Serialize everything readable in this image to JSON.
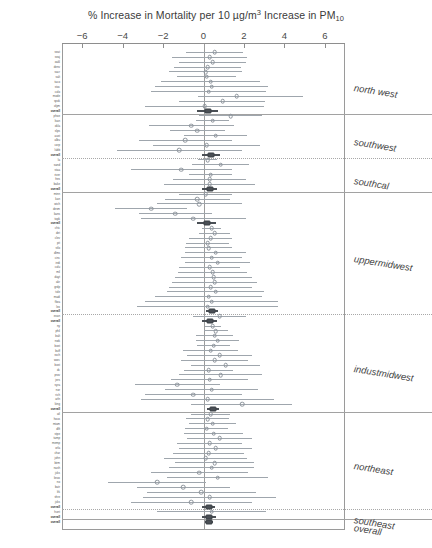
{
  "chart": {
    "type": "forest",
    "title_parts": {
      "pre": "% Increase in Mortality per 10 µg/m",
      "sup": "3",
      "mid": " Increase in PM",
      "sub": "10"
    },
    "title_plain": "% Increase in Mortality per 10 µg/m3 Increase in PM10",
    "xlabel": "",
    "ylabel": "",
    "xlim": [
      -7,
      7
    ],
    "xticks": [
      -6,
      -4,
      -2,
      0,
      2,
      4,
      6
    ],
    "xtick_labels": [
      "−6",
      "−4",
      "−2",
      "0",
      "2",
      "4",
      "6"
    ],
    "zero_reference": 0,
    "grid": false,
    "legend": null,
    "marker_open": "city estimate",
    "marker_filled": "regional / overall pooled estimate",
    "colors": {
      "point": "#8d949c",
      "ci": "#9fa6ad",
      "pooled": "#4a4f55",
      "axis": "#9a9a9a",
      "separator": "#a8a8a8",
      "text": "#3a3a3a"
    }
  },
  "regions": [
    {
      "name": "north west",
      "separator": "solid",
      "cities": [
        {
          "label": "seat",
          "est": 0.55,
          "lo": -0.85,
          "hi": 1.95,
          "pooled": false
        },
        {
          "label": "seaj",
          "est": 0.3,
          "lo": -1.55,
          "hi": 2.15,
          "pooled": false
        },
        {
          "label": "oakl",
          "est": 0.45,
          "lo": -1.2,
          "hi": 2.1,
          "pooled": false
        },
        {
          "label": "denv",
          "est": 0.2,
          "lo": -1.45,
          "hi": 1.85,
          "pooled": false
        },
        {
          "label": "sacr",
          "est": 0.1,
          "lo": -1.7,
          "hi": 1.9,
          "pooled": false
        },
        {
          "label": "salt",
          "est": 0.15,
          "lo": -1.3,
          "hi": 1.6,
          "pooled": false
        },
        {
          "label": "taco",
          "est": 0.35,
          "lo": -2.1,
          "hi": 2.8,
          "pooled": false
        },
        {
          "label": "stoc",
          "est": 0.4,
          "lo": -2.4,
          "hi": 3.2,
          "pooled": false
        },
        {
          "label": "colo",
          "est": 0.25,
          "lo": -2.6,
          "hi": 3.1,
          "pooled": false
        },
        {
          "label": "mode",
          "est": 1.65,
          "lo": -0.25,
          "hi": 4.9,
          "pooled": false
        },
        {
          "label": "spok",
          "est": 0.95,
          "lo": -1.2,
          "hi": 3.05,
          "pooled": false
        },
        {
          "label": "olym",
          "est": 0.05,
          "lo": -2.9,
          "hi": 3.0,
          "pooled": false
        },
        {
          "label": "overall",
          "est": 0.22,
          "lo": -0.3,
          "hi": 0.74,
          "pooled": true
        }
      ]
    },
    {
      "name": "southwest",
      "separator": "solid",
      "cities": [
        {
          "label": "phoe",
          "est": 1.35,
          "lo": -0.2,
          "hi": 2.9,
          "pooled": false
        },
        {
          "label": "lsan",
          "est": 0.45,
          "lo": -0.35,
          "hi": 1.25,
          "pooled": false
        },
        {
          "label": "okla",
          "est": -0.6,
          "lo": -2.7,
          "hi": 1.5,
          "pooled": false
        },
        {
          "label": "slps",
          "est": -0.3,
          "lo": -1.65,
          "hi": 1.05,
          "pooled": false
        },
        {
          "label": "aust",
          "est": 0.6,
          "lo": -0.95,
          "hi": 2.15,
          "pooled": false
        },
        {
          "label": "albu",
          "est": -0.9,
          "lo": -3.2,
          "hi": 1.4,
          "pooled": false
        },
        {
          "label": "corp",
          "est": 0.15,
          "lo": -2.5,
          "hi": 2.8,
          "pooled": false
        },
        {
          "label": "lubb",
          "est": -1.2,
          "lo": -4.3,
          "hi": 1.9,
          "pooled": false
        },
        {
          "label": "overall",
          "est": 0.38,
          "lo": -0.05,
          "hi": 0.81,
          "pooled": true
        }
      ]
    },
    {
      "name": "southcal",
      "separator": "dotted",
      "cities": [
        {
          "label": "la",
          "est": 0.2,
          "lo": -0.25,
          "hi": 0.65,
          "pooled": false
        },
        {
          "label": "sand",
          "est": 0.85,
          "lo": -0.55,
          "hi": 2.25,
          "pooled": false
        },
        {
          "label": "staa",
          "est": -1.1,
          "lo": -3.6,
          "hi": 1.4,
          "pooled": false
        },
        {
          "label": "river",
          "est": 0.35,
          "lo": -0.7,
          "hi": 1.4,
          "pooled": false
        },
        {
          "label": "fres",
          "est": 0.3,
          "lo": -1.5,
          "hi": 2.1,
          "pooled": false
        },
        {
          "label": "bake",
          "est": 0.3,
          "lo": -1.95,
          "hi": 2.55,
          "pooled": false
        },
        {
          "label": "overall",
          "est": 0.3,
          "lo": -0.05,
          "hi": 0.65,
          "pooled": true
        }
      ]
    },
    {
      "name": "uppermidwest",
      "separator": "solid",
      "cities": [
        {
          "label": "minn",
          "est": 0.1,
          "lo": -1.2,
          "hi": 1.4,
          "pooled": false
        },
        {
          "label": "kan",
          "est": -0.3,
          "lo": -1.9,
          "hi": 1.3,
          "pooled": false
        },
        {
          "label": "wich",
          "est": -0.2,
          "lo": -2.3,
          "hi": 1.9,
          "pooled": false
        },
        {
          "label": "desm",
          "est": -2.6,
          "lo": -4.4,
          "hi": -0.8,
          "pooled": false
        },
        {
          "label": "kans",
          "est": -1.4,
          "lo": -3.2,
          "hi": 0.4,
          "pooled": false
        },
        {
          "label": "topk",
          "est": -0.5,
          "lo": -3.1,
          "hi": 2.1,
          "pooled": false
        },
        {
          "label": "overall",
          "est": 0.15,
          "lo": -0.3,
          "hi": 0.6,
          "pooled": true
        },
        {
          "label": "chic",
          "est": 0.4,
          "lo": -0.05,
          "hi": 0.85,
          "pooled": false
        },
        {
          "label": "det",
          "est": 0.55,
          "lo": -0.2,
          "hi": 1.3,
          "pooled": false
        },
        {
          "label": "clev",
          "est": 0.35,
          "lo": -0.7,
          "hi": 1.4,
          "pooled": false
        },
        {
          "label": "pit",
          "est": 0.2,
          "lo": -0.85,
          "hi": 1.25,
          "pooled": false
        },
        {
          "label": "stlo",
          "est": 0.25,
          "lo": -0.9,
          "hi": 1.4,
          "pooled": false
        },
        {
          "label": "dlms",
          "est": 0.6,
          "lo": -0.9,
          "hi": 2.1,
          "pooled": false
        },
        {
          "label": "cinc",
          "est": 0.4,
          "lo": -1.1,
          "hi": 1.9,
          "pooled": false
        },
        {
          "label": "indi",
          "est": 0.7,
          "lo": -0.9,
          "hi": 2.3,
          "pooled": false
        },
        {
          "label": "colu",
          "est": 0.3,
          "lo": -1.2,
          "hi": 1.8,
          "pooled": false
        },
        {
          "label": "mil",
          "est": 0.45,
          "lo": -1.25,
          "hi": 2.15,
          "pooled": false
        },
        {
          "label": "dayt",
          "est": 0.5,
          "lo": -1.4,
          "hi": 2.4,
          "pooled": false
        },
        {
          "label": "akr",
          "est": 0.55,
          "lo": -1.55,
          "hi": 2.65,
          "pooled": false
        },
        {
          "label": "grdp",
          "est": 0.35,
          "lo": -1.7,
          "hi": 2.4,
          "pooled": false
        },
        {
          "label": "tole",
          "est": 0.6,
          "lo": -1.8,
          "hi": 3.0,
          "pooled": false
        },
        {
          "label": "madi",
          "est": 0.25,
          "lo": -2.4,
          "hi": 2.9,
          "pooled": false
        },
        {
          "label": "flwa",
          "est": 0.4,
          "lo": -2.9,
          "hi": 3.7,
          "pooled": false
        },
        {
          "label": "lex",
          "est": 0.2,
          "lo": -3.3,
          "hi": 3.7,
          "pooled": false
        },
        {
          "label": "overall",
          "est": 0.42,
          "lo": 0.1,
          "hi": 0.74,
          "pooled": true
        }
      ]
    },
    {
      "name": "industmidwest",
      "separator": "dotted",
      "cities": [
        {
          "label": "evan",
          "est": 0.8,
          "lo": -0.5,
          "hi": 2.1,
          "pooled": false
        },
        {
          "label": "overall",
          "est": 0.3,
          "lo": -0.05,
          "hi": 0.65,
          "pooled": true
        },
        {
          "label": "ny",
          "est": 0.45,
          "lo": 0.05,
          "hi": 0.85,
          "pooled": false
        },
        {
          "label": "phil",
          "est": 0.6,
          "lo": 0.0,
          "hi": 1.2,
          "pooled": false
        },
        {
          "label": "balt",
          "est": 0.55,
          "lo": -0.35,
          "hi": 1.45,
          "pooled": false
        },
        {
          "label": "nwk",
          "est": 0.7,
          "lo": -0.35,
          "hi": 1.75,
          "pooled": false
        },
        {
          "label": "bost",
          "est": 0.5,
          "lo": -0.3,
          "hi": 1.3,
          "pooled": false
        },
        {
          "label": "buff",
          "est": 0.35,
          "lo": -1.0,
          "hi": 1.7,
          "pooled": false
        },
        {
          "label": "roch",
          "est": 0.8,
          "lo": -0.8,
          "hi": 2.4,
          "pooled": false
        },
        {
          "label": "worc",
          "est": 0.55,
          "lo": -1.1,
          "hi": 2.2,
          "pooled": false
        },
        {
          "label": "bost",
          "est": 1.1,
          "lo": -0.6,
          "hi": 2.8,
          "pooled": false
        },
        {
          "label": "dc",
          "est": 0.25,
          "lo": -0.95,
          "hi": 1.45,
          "pooled": false
        },
        {
          "label": "prov",
          "est": 0.85,
          "lo": -1.2,
          "hi": 2.9,
          "pooled": false
        },
        {
          "label": "jers",
          "est": 0.3,
          "lo": -1.6,
          "hi": 2.2,
          "pooled": false
        },
        {
          "label": "syra",
          "est": -1.3,
          "lo": -3.4,
          "hi": 0.8,
          "pooled": false
        },
        {
          "label": "nor",
          "est": 0.4,
          "lo": -1.9,
          "hi": 2.7,
          "pooled": false
        },
        {
          "label": "rich",
          "est": -0.5,
          "lo": -2.9,
          "hi": 1.9,
          "pooled": false
        },
        {
          "label": "arln",
          "est": 0.2,
          "lo": -3.1,
          "hi": 3.5,
          "pooled": false
        },
        {
          "label": "king",
          "est": 1.9,
          "lo": -0.6,
          "hi": 4.4,
          "pooled": false
        },
        {
          "label": "overall",
          "est": 0.48,
          "lo": 0.18,
          "hi": 0.78,
          "pooled": true
        }
      ]
    },
    {
      "name": "northeast",
      "separator": "solid",
      "cities": [
        {
          "label": "atl",
          "est": 0.35,
          "lo": -0.6,
          "hi": 1.3,
          "pooled": false
        },
        {
          "label": "hous",
          "est": 0.2,
          "lo": -0.85,
          "hi": 1.25,
          "pooled": false
        },
        {
          "label": "miam",
          "est": 0.45,
          "lo": -0.7,
          "hi": 1.6,
          "pooled": false
        },
        {
          "label": "dlft",
          "est": 0.15,
          "lo": -0.9,
          "hi": 1.2,
          "pooled": false
        },
        {
          "label": "stpe",
          "est": 0.5,
          "lo": -0.95,
          "hi": 1.95,
          "pooled": false
        },
        {
          "label": "tamp",
          "est": 0.8,
          "lo": -0.8,
          "hi": 2.4,
          "pooled": false
        },
        {
          "label": "memp",
          "est": 0.3,
          "lo": -1.3,
          "hi": 1.9,
          "pooled": false
        },
        {
          "label": "orla",
          "est": 0.6,
          "lo": -1.2,
          "hi": 2.4,
          "pooled": false
        },
        {
          "label": "char",
          "est": 0.25,
          "lo": -1.5,
          "hi": 2.0,
          "pooled": false
        },
        {
          "label": "john",
          "est": 0.1,
          "lo": -1.95,
          "hi": 2.15,
          "pooled": false
        },
        {
          "label": "birm",
          "est": 0.55,
          "lo": -1.4,
          "hi": 2.5,
          "pooled": false
        },
        {
          "label": "nash",
          "est": 0.4,
          "lo": -1.7,
          "hi": 2.5,
          "pooled": false
        },
        {
          "label": "jcks",
          "est": -0.2,
          "lo": -2.6,
          "hi": 2.2,
          "pooled": false
        },
        {
          "label": "knox",
          "est": 0.7,
          "lo": -1.8,
          "hi": 3.2,
          "pooled": false
        },
        {
          "label": "no",
          "est": -2.3,
          "lo": -4.7,
          "hi": 0.1,
          "pooled": false
        },
        {
          "label": "batr",
          "est": -1.0,
          "lo": -3.3,
          "hi": 1.3,
          "pooled": false
        },
        {
          "label": "lrk",
          "est": -0.1,
          "lo": -2.8,
          "hi": 2.6,
          "pooled": false
        },
        {
          "label": "shre",
          "est": 0.3,
          "lo": -3.0,
          "hi": 3.6,
          "pooled": false
        },
        {
          "label": "jcks",
          "est": -0.6,
          "lo": -3.6,
          "hi": 2.4,
          "pooled": false
        },
        {
          "label": "overall",
          "est": 0.26,
          "lo": -0.05,
          "hi": 0.57,
          "pooled": true
        }
      ]
    },
    {
      "name": "southeast",
      "separator": "dotted",
      "cities": [
        {
          "label": "hunt",
          "est": 0.4,
          "lo": -2.3,
          "hi": 3.1,
          "pooled": false
        },
        {
          "label": "overall",
          "est": 0.28,
          "lo": -0.05,
          "hi": 0.61,
          "pooled": true
        }
      ]
    },
    {
      "name": "overall",
      "separator": "solid",
      "cities": [
        {
          "label": "overall",
          "est": 0.29,
          "lo": 0.09,
          "hi": 0.49,
          "pooled": true
        }
      ]
    }
  ]
}
